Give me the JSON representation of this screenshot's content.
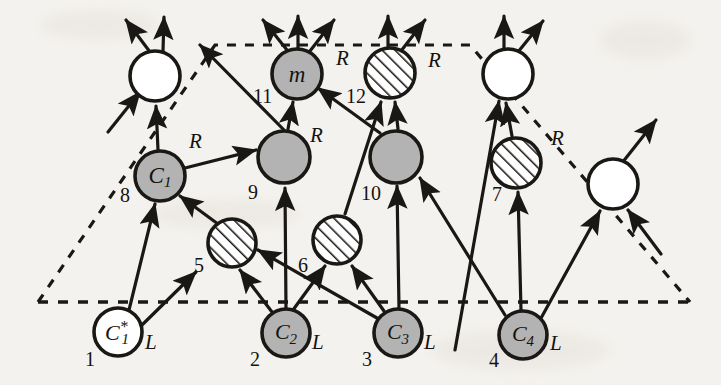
{
  "figure": {
    "background_color": "#f4f2ee",
    "stroke_color": "#1a1815",
    "fill_gray": "#b3b3b3",
    "fill_white": "#ffffff",
    "hatch_color": "#1a1815"
  },
  "boundary": {
    "name": "dashed-trapezoid",
    "style": "dashed",
    "points": "38,302 215,45 470,45 690,302"
  },
  "nodes": [
    {
      "id": "n-top-left",
      "label": "",
      "fill": "white",
      "cx": 155,
      "cy": 76,
      "r": 25
    },
    {
      "id": "n-m",
      "label": "m",
      "fill": "gray",
      "cx": 297,
      "cy": 74,
      "r": 25
    },
    {
      "id": "n-12",
      "label": "",
      "fill": "hatched",
      "cx": 390,
      "cy": 73,
      "r": 25
    },
    {
      "id": "n-top-right",
      "label": "",
      "fill": "white",
      "cx": 508,
      "cy": 74,
      "r": 25
    },
    {
      "id": "n-c1",
      "label": "C1",
      "fill": "gray",
      "cx": 160,
      "cy": 176,
      "r": 25
    },
    {
      "id": "n-9",
      "label": "",
      "fill": "gray",
      "cx": 284,
      "cy": 157,
      "r": 26
    },
    {
      "id": "n-10",
      "label": "",
      "fill": "gray",
      "cx": 396,
      "cy": 157,
      "r": 26
    },
    {
      "id": "n-7",
      "label": "",
      "fill": "hatched",
      "cx": 516,
      "cy": 163,
      "r": 25
    },
    {
      "id": "n-right",
      "label": "",
      "fill": "white",
      "cx": 613,
      "cy": 184,
      "r": 25
    },
    {
      "id": "n-5",
      "label": "",
      "fill": "hatched",
      "cx": 232,
      "cy": 243,
      "r": 24
    },
    {
      "id": "n-6",
      "label": "",
      "fill": "hatched",
      "cx": 337,
      "cy": 240,
      "r": 24
    },
    {
      "id": "n-c1star",
      "label": "C1*",
      "fill": "white",
      "cx": 118,
      "cy": 332,
      "r": 24
    },
    {
      "id": "n-c2",
      "label": "C2",
      "fill": "gray",
      "cx": 286,
      "cy": 333,
      "r": 24
    },
    {
      "id": "n-c3",
      "label": "C3",
      "fill": "gray",
      "cx": 398,
      "cy": 333,
      "r": 24
    },
    {
      "id": "n-c4",
      "label": "C4",
      "fill": "gray",
      "cx": 523,
      "cy": 335,
      "r": 24
    }
  ],
  "node_labels": {
    "m": "m",
    "c1": "C",
    "c1_sub": "1",
    "c1star": "C",
    "c1star_sub": "1",
    "c1star_sup": "*",
    "c2": "C",
    "c2_sub": "2",
    "c3": "C",
    "c3_sub": "3",
    "c4": "C",
    "c4_sub": "4"
  },
  "edge_labels": [
    {
      "id": "r-c1",
      "text": "R",
      "x": 189,
      "y": 131
    },
    {
      "id": "r-9",
      "text": "R",
      "x": 310,
      "y": 128
    },
    {
      "id": "r-m",
      "text": "R",
      "x": 336,
      "y": 51
    },
    {
      "id": "r-12",
      "text": "R",
      "x": 428,
      "y": 53
    },
    {
      "id": "r-7",
      "text": "R",
      "x": 551,
      "y": 132
    }
  ],
  "index_labels": [
    {
      "id": "idx-8",
      "text": "8",
      "x": 123,
      "y": 194
    },
    {
      "id": "idx-11",
      "text": "11",
      "x": 258,
      "y": 94
    },
    {
      "id": "idx-12",
      "text": "12",
      "x": 350,
      "y": 95
    },
    {
      "id": "idx-9",
      "text": "9",
      "x": 250,
      "y": 192
    },
    {
      "id": "idx-10",
      "text": "10",
      "x": 365,
      "y": 193
    },
    {
      "id": "idx-7",
      "text": "7",
      "x": 496,
      "y": 194
    },
    {
      "id": "idx-5",
      "text": "5",
      "x": 198,
      "y": 265
    },
    {
      "id": "idx-6",
      "text": "6",
      "x": 302,
      "y": 265
    },
    {
      "id": "idx-1",
      "text": "1",
      "x": 89,
      "y": 361
    },
    {
      "id": "idx-2",
      "text": "2",
      "x": 254,
      "y": 360
    },
    {
      "id": "idx-3",
      "text": "3",
      "x": 366,
      "y": 360
    },
    {
      "id": "idx-4",
      "text": "4",
      "x": 493,
      "y": 359
    }
  ],
  "leaf_labels": [
    {
      "id": "l-1",
      "text": "L",
      "x": 148,
      "y": 342
    },
    {
      "id": "l-2",
      "text": "L",
      "x": 315,
      "y": 342
    },
    {
      "id": "l-3",
      "text": "L",
      "x": 427,
      "y": 342
    },
    {
      "id": "l-4",
      "text": "L",
      "x": 553,
      "y": 343
    }
  ],
  "edges": [
    {
      "from": "n-c1star",
      "to": "n-c1",
      "kind": "solid-arrow"
    },
    {
      "from": "n-c1star",
      "to": "n-5",
      "kind": "solid-arrow"
    },
    {
      "from": "n-5",
      "to": "n-c1",
      "kind": "solid-arrow"
    },
    {
      "from": "n-c1",
      "to": "n-top-left",
      "kind": "solid-arrow",
      "label": "R"
    },
    {
      "from": "n-c1",
      "to": "n-9",
      "kind": "solid-arrow"
    },
    {
      "from": "n-c2",
      "to": "n-5",
      "kind": "solid-arrow"
    },
    {
      "from": "n-c2",
      "to": "n-9",
      "kind": "solid-arrow"
    },
    {
      "from": "n-c2",
      "to": "n-6",
      "kind": "solid-arrow"
    },
    {
      "from": "n-c3",
      "to": "n-5",
      "kind": "solid-arrow"
    },
    {
      "from": "n-c3",
      "to": "n-6",
      "kind": "solid-arrow"
    },
    {
      "from": "n-c3",
      "to": "n-10",
      "kind": "solid-arrow"
    },
    {
      "from": "n-6",
      "to": "n-12",
      "kind": "solid-arrow"
    },
    {
      "from": "n-9",
      "to": "n-m",
      "kind": "solid-arrow",
      "label": "R"
    },
    {
      "from": "n-9",
      "to": "n-up-left-out",
      "kind": "solid-arrow"
    },
    {
      "from": "n-10",
      "to": "n-m",
      "kind": "solid-arrow"
    },
    {
      "from": "n-10",
      "to": "n-12",
      "kind": "solid-arrow"
    },
    {
      "from": "n-c4",
      "to": "n-10",
      "kind": "solid-arrow"
    },
    {
      "from": "n-c4",
      "to": "n-7",
      "kind": "solid-arrow"
    },
    {
      "from": "n-c4",
      "to": "n-right",
      "kind": "solid-arrow"
    },
    {
      "from": "n-7",
      "to": "n-top-right",
      "kind": "solid-arrow",
      "label": "R"
    },
    {
      "from": "external-4",
      "to": "n-top-right",
      "kind": "solid-arrow"
    },
    {
      "from": "external-left",
      "to": "n-top-left",
      "kind": "solid-arrow"
    },
    {
      "from": "external-right",
      "to": "n-right",
      "kind": "solid-arrow"
    },
    {
      "from": "n-right",
      "to": "out-up",
      "kind": "solid-arrow"
    }
  ]
}
